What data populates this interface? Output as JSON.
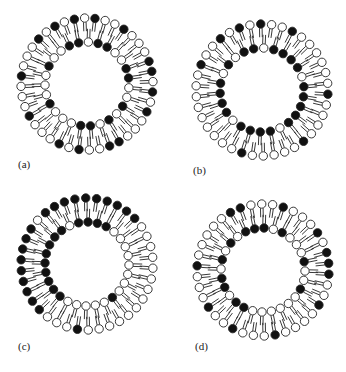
{
  "figure": {
    "colors": {
      "dark_head": "#111111",
      "light_head": "#ffffff",
      "stroke": "#222222",
      "background": "#ffffff"
    },
    "panels": [
      {
        "id": "a",
        "label": "(a)",
        "label_pos": [
          18,
          166
        ],
        "center": [
          87,
          84
        ],
        "outer_r": 66,
        "inner_r": 42,
        "tail_len": 9,
        "outer": "LDLDLLDLLLDDLDLDLLLDDLLDLDLLLDLLLDLLLDLD",
        "inner": "DLDDLLDDLLDLDLDDLLLDLLLDLLD"
      },
      {
        "id": "b",
        "label": "(b)",
        "label_pos": [
          193,
          172
        ],
        "center": [
          262,
          90
        ],
        "outer_r": 66,
        "inner_r": 42,
        "tail_len": 9,
        "outer": "DLDLLDLLLLLLDLLLLDLLLLLDLLLLLLLLLDLLDL",
        "inner": "DLDDDDLDDDDDLDDDDLDDDDLDLD"
      },
      {
        "id": "c",
        "label": "(c)",
        "label_pos": [
          18,
          348
        ],
        "center": [
          87,
          264
        ],
        "outer_r": 66,
        "inner_r": 42,
        "tail_len": 9,
        "outer": "DDDDDDDDLLLLLLLLLLLLLLDLLLDDDDDDDDDLDD",
        "inner": "DDDDLLLLLLLLDLLLLLDDDDDDDDDL"
      },
      {
        "id": "d",
        "label": "(d)",
        "label_pos": [
          195,
          348
        ],
        "center": [
          263,
          270
        ],
        "outer_r": 66,
        "inner_r": 42,
        "tail_len": 9,
        "outer": "DLLLDLLLDLDDDLLDLLLLDLLLDLLDLLLDLLLLLD",
        "inner": "DDLDLLLDLLDLLLLLLDDLDDLDLDLD"
      }
    ]
  }
}
